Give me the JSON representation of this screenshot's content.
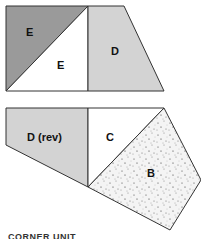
{
  "diagram": {
    "top_group": {
      "pieces": [
        {
          "id": "E1",
          "label": "E",
          "fill": "#9a9a9a"
        },
        {
          "id": "E2",
          "label": "E",
          "fill": "#ffffff"
        },
        {
          "id": "D",
          "label": "D",
          "fill": "#d3d3d3"
        }
      ]
    },
    "bottom_group": {
      "pieces": [
        {
          "id": "Drev",
          "label": "D (rev)",
          "fill": "#d3d3d3"
        },
        {
          "id": "C",
          "label": "C",
          "fill": "#ffffff"
        },
        {
          "id": "B",
          "label": "B",
          "fill": "#f4f4f4",
          "pattern": "speckled"
        }
      ]
    },
    "caption": "CORNER UNIT",
    "stroke_color": "#333333"
  }
}
